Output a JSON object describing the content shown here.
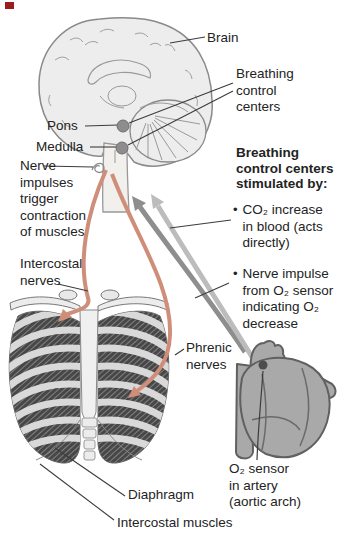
{
  "figure": {
    "corner_mark_color": "#9b1c1c",
    "bullet_char": "•",
    "labels": {
      "brain": "Brain",
      "breathing_control_centers": "Breathing\ncontrol\ncenters",
      "pons": "Pons",
      "medulla": "Medulla",
      "nerve_impulses": "Nerve\nimpulses\ntrigger\ncontraction\nof muscles",
      "intercostal_nerves": "Intercostal\nnerves",
      "phrenic_nerves": "Phrenic\nnerves",
      "diaphragm": "Diaphragm",
      "intercostal_muscles": "Intercostal muscles",
      "o2_sensor": "O₂ sensor\nin artery\n(aortic arch)"
    },
    "callout": {
      "heading": "Breathing\ncontrol centers\nstimulated by:",
      "bullets": [
        "CO₂ increase\nin blood (acts\ndirectly)",
        "Nerve impulse\nfrom O₂ sensor\nindicating O₂\ndecrease"
      ]
    },
    "colors": {
      "nerve_path": "#cf8e7a",
      "arrow_dark": "#8e8e8e",
      "arrow_light": "#bcbcbc",
      "brain_fill": "#ededed",
      "organ_fill": "#a9a9a9",
      "outline_gray": "#8a8a8a",
      "text": "#232323"
    }
  }
}
